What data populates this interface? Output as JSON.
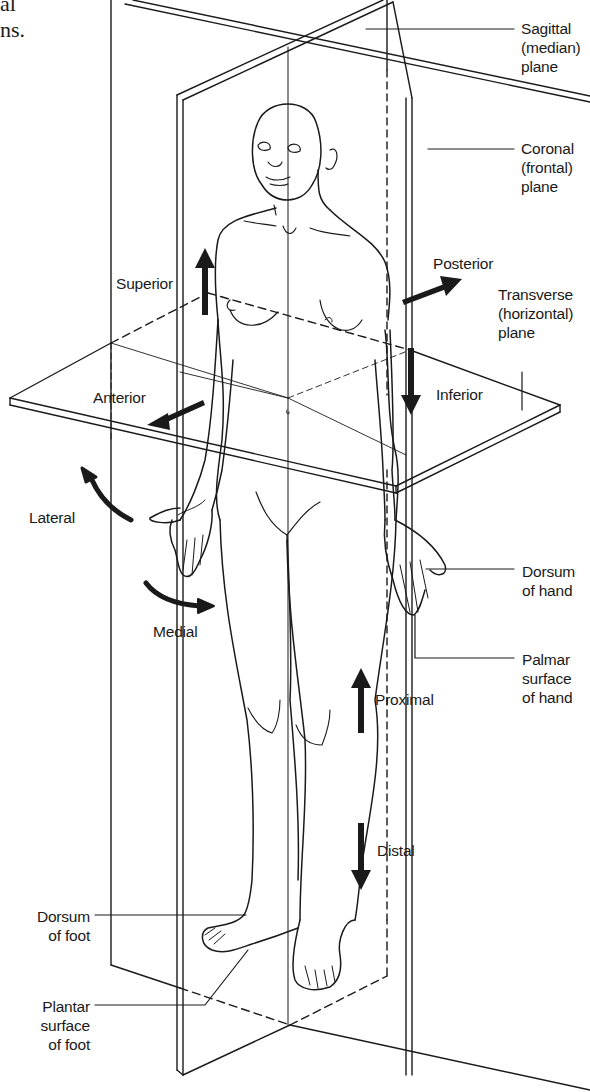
{
  "figure": {
    "title_fragments": [
      "al",
      "ns."
    ]
  },
  "planes": [
    {
      "id": "sagittal",
      "label_lines": [
        "Sagittal",
        "(median)",
        "plane"
      ]
    },
    {
      "id": "coronal",
      "label_lines": [
        "Coronal",
        "(frontal)",
        "plane"
      ]
    },
    {
      "id": "transverse",
      "label_lines": [
        "Transverse",
        "(horizontal)",
        "plane"
      ]
    }
  ],
  "directions": {
    "superior": "Superior",
    "inferior": "Inferior",
    "anterior": "Anterior",
    "posterior": "Posterior",
    "lateral": "Lateral",
    "medial": "Medial",
    "proximal": "Proximal",
    "distal": "Distal"
  },
  "surfaces": {
    "dorsum_hand": [
      "Dorsum",
      "of hand"
    ],
    "palmar_hand": [
      "Palmar",
      "surface",
      "of hand"
    ],
    "dorsum_foot": [
      "Dorsum",
      "of foot"
    ],
    "plantar_foot": [
      "Plantar",
      "surface",
      "of foot"
    ]
  },
  "colors": {
    "ink": "#1a1a1a",
    "background": "#ffffff"
  }
}
